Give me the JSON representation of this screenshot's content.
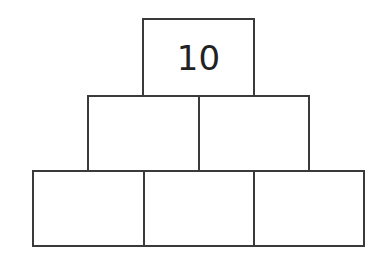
{
  "diagram": {
    "type": "number-pyramid",
    "rows": [
      {
        "row": 1,
        "cells": [
          {
            "value": "10"
          }
        ]
      },
      {
        "row": 2,
        "cells": [
          {
            "value": ""
          },
          {
            "value": ""
          }
        ]
      },
      {
        "row": 3,
        "cells": [
          {
            "value": ""
          },
          {
            "value": ""
          },
          {
            "value": ""
          }
        ]
      }
    ],
    "colors": {
      "border": "#3a3a3a",
      "background": "#ffffff",
      "text": "#222222"
    }
  }
}
